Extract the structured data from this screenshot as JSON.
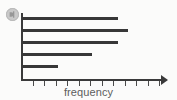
{
  "badge": {
    "name": "circular-watermark-badge",
    "color": "#c9c9c9"
  },
  "chart_data": {
    "type": "bar",
    "orientation": "horizontal",
    "title": "",
    "xlabel": "frequency",
    "ylabel": "",
    "categories": [
      "category-1",
      "category-2",
      "category-3",
      "category-4",
      "category-5"
    ],
    "values": [
      8.1,
      9.0,
      8.1,
      5.9,
      3.0
    ],
    "bar_pixel_ends": [
      118,
      128,
      118,
      92,
      58
    ],
    "xlim": [
      0,
      12
    ],
    "x_tick_count": 12,
    "x_tick_labels": [
      "",
      "",
      "",
      "",
      "",
      "",
      "",
      "",
      "",
      "",
      "",
      ""
    ],
    "y_tick_labels": [],
    "grid": false,
    "legend": null,
    "bar_color": "#373737",
    "axis_color": "#3a3a3a",
    "label_color": "#5d5d5d",
    "background_color": "#fbfbfa",
    "axis_has_arrow": true
  }
}
